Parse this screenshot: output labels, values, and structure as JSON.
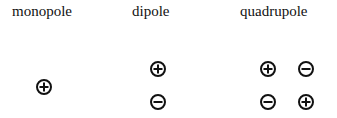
{
  "diagram": {
    "labels": {
      "monopole": "monopole",
      "dipole": "dipole",
      "quadrupole": "quadrupole"
    },
    "groups": [
      {
        "name": "monopole",
        "charges": [
          {
            "sign": "+",
            "x": 44,
            "y": 87
          }
        ]
      },
      {
        "name": "dipole",
        "charges": [
          {
            "sign": "+",
            "x": 158,
            "y": 69
          },
          {
            "sign": "-",
            "x": 158,
            "y": 102
          }
        ]
      },
      {
        "name": "quadrupole",
        "charges": [
          {
            "sign": "+",
            "x": 268,
            "y": 69
          },
          {
            "sign": "-",
            "x": 306,
            "y": 69
          },
          {
            "sign": "-",
            "x": 268,
            "y": 102
          },
          {
            "sign": "+",
            "x": 306,
            "y": 102
          }
        ]
      }
    ],
    "colors": {
      "stroke": "#111111",
      "background": "#ffffff"
    }
  }
}
